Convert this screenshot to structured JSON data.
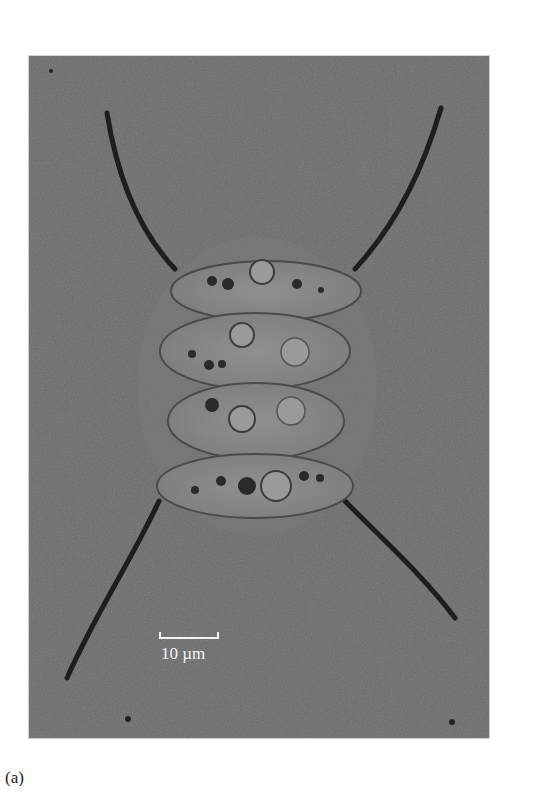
{
  "figure": {
    "panel_label": "(a)",
    "scale_bar": {
      "label": "10 µm"
    },
    "colors": {
      "background_gray": "#6b6b6b",
      "spine": "#1e1e1e",
      "cell_fill": "#8a8a8a",
      "cell_outline": "#4a4a4a",
      "scale_bar": "#f2f2f2",
      "page": "#ffffff"
    }
  }
}
